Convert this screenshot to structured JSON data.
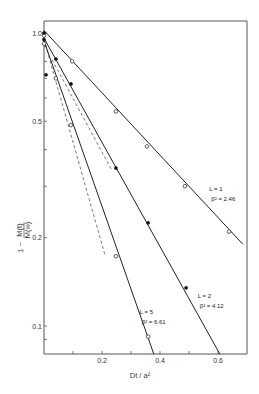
{
  "chart_data": {
    "type": "line",
    "title": "",
    "xlabel": "Dt / a²",
    "ylabel": "1 - M(t) / M(∞)",
    "xscale": "linear",
    "yscale": "log",
    "xlim": [
      0,
      0.7
    ],
    "ylim": [
      0.08,
      1.1
    ],
    "grid": false,
    "legend": "none",
    "x_ticks": [
      {
        "value": 0.1,
        "label": ""
      },
      {
        "value": 0.2,
        "label": "0.2"
      },
      {
        "value": 0.3,
        "label": ""
      },
      {
        "value": 0.4,
        "label": "0.4"
      },
      {
        "value": 0.5,
        "label": ""
      },
      {
        "value": 0.6,
        "label": "0.6"
      }
    ],
    "y_ticks": [
      {
        "value": 1.0,
        "label": "1.0"
      },
      {
        "value": 0.9,
        "label": ""
      },
      {
        "value": 0.8,
        "label": ""
      },
      {
        "value": 0.7,
        "label": ""
      },
      {
        "value": 0.6,
        "label": ""
      },
      {
        "value": 0.5,
        "label": "0.5"
      },
      {
        "value": 0.4,
        "label": ""
      },
      {
        "value": 0.3,
        "label": ""
      },
      {
        "value": 0.2,
        "label": "0.2"
      },
      {
        "value": 0.1,
        "label": "0.1"
      },
      {
        "value": 0.09,
        "label": ""
      }
    ],
    "series": [
      {
        "name": "L = 1",
        "beta2_label": "β² = 2.46",
        "beta2": 2.46,
        "marker": "open-circle",
        "line": {
          "x0": 0,
          "y0": 1.02,
          "x1": 0.686,
          "y1": 0.19
        },
        "points": [
          {
            "x": 0.0,
            "y": 0.98
          },
          {
            "x": 0.097,
            "y": 0.8
          },
          {
            "x": 0.248,
            "y": 0.54
          },
          {
            "x": 0.355,
            "y": 0.41
          },
          {
            "x": 0.486,
            "y": 0.3
          },
          {
            "x": 0.638,
            "y": 0.21
          }
        ],
        "annotation_at": {
          "x": 0.57,
          "y": 0.29
        }
      },
      {
        "name": "L = 2",
        "beta2_label": "β² = 4.12",
        "beta2": 4.12,
        "marker": "filled-circle",
        "line": {
          "x0": 0,
          "y0": 0.96,
          "x1": 0.607,
          "y1": 0.08
        },
        "points": [
          {
            "x": 0.0,
            "y": 0.95
          },
          {
            "x": 0.041,
            "y": 0.815
          },
          {
            "x": 0.093,
            "y": 0.67
          },
          {
            "x": 0.248,
            "y": 0.346
          },
          {
            "x": 0.359,
            "y": 0.225
          },
          {
            "x": 0.49,
            "y": 0.135
          }
        ],
        "annotation_at": {
          "x": 0.53,
          "y": 0.125
        }
      },
      {
        "name": "L = 5",
        "beta2_label": "β² = 6.61",
        "beta2": 6.61,
        "marker": "open-circle",
        "line": {
          "x0": 0,
          "y0": 0.94,
          "x1": 0.379,
          "y1": 0.08
        },
        "points": [
          {
            "x": 0.0,
            "y": 0.92
          },
          {
            "x": 0.041,
            "y": 0.7
          },
          {
            "x": 0.093,
            "y": 0.485
          },
          {
            "x": 0.248,
            "y": 0.173
          },
          {
            "x": 0.359,
            "y": 0.092
          }
        ],
        "annotation_at": {
          "x": 0.33,
          "y": 0.11
        }
      }
    ],
    "dashed_lines": [
      {
        "name": "short-time asymptote A",
        "x0": 0.0,
        "y0": 0.95,
        "x1": 0.21,
        "y1": 0.175
      },
      {
        "name": "short-time asymptote B",
        "x0": 0.028,
        "y0": 0.81,
        "x1": 0.234,
        "y1": 0.34
      }
    ],
    "extra_points": [
      {
        "x": 0.0,
        "y": 1.0,
        "marker": "filled-circle"
      },
      {
        "x": 0.007,
        "y": 0.72,
        "marker": "filled-circle"
      }
    ]
  }
}
